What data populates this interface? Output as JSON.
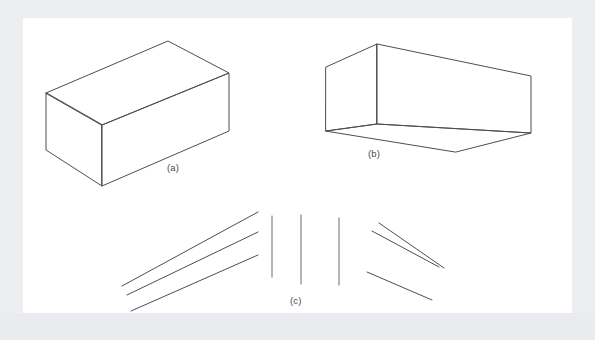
{
  "figure": {
    "background_color": "#eceef0",
    "plate_color": "#ffffff",
    "stroke_color": "#4d4d55",
    "label_color": "#4a4a4f",
    "panels": [
      {
        "id": "a",
        "label": "(a)",
        "description": "Wireframe rectangular block seen from above, left-facing",
        "label_x": 167,
        "label_y": 162
      },
      {
        "id": "b",
        "label": "(b)",
        "description": "Wireframe rectangular block seen from below, right-facing",
        "label_x": 368,
        "label_y": 148
      },
      {
        "id": "c",
        "label": "(c)",
        "description": "Three groups of line segments: diverging, parallel vertical, converging",
        "label_x": 290,
        "label_y": 295
      }
    ],
    "footer_text": "",
    "shapes": {
      "box_a": {
        "type": "polyline-set",
        "stroke": "#4d4d55",
        "stroke_width": 1,
        "vertices": {
          "top_apex": [
            168,
            41
          ],
          "top_left": [
            46,
            93
          ],
          "top_front": [
            102,
            125
          ],
          "top_right": [
            229,
            73
          ],
          "bottom_right": [
            229,
            131
          ],
          "bottom_front": [
            102,
            186
          ],
          "bottom_left": [
            46,
            150
          ]
        },
        "edges": [
          [
            "top_left",
            "top_apex"
          ],
          [
            "top_apex",
            "top_right"
          ],
          [
            "top_right",
            "top_front"
          ],
          [
            "top_front",
            "top_left"
          ],
          [
            "top_left",
            "bottom_left"
          ],
          [
            "bottom_left",
            "bottom_front"
          ],
          [
            "top_front",
            "bottom_front"
          ],
          [
            "bottom_front",
            "bottom_right"
          ],
          [
            "top_right",
            "bottom_right"
          ]
        ]
      },
      "box_b": {
        "type": "polyline-set",
        "stroke": "#4d4d55",
        "stroke_width": 1,
        "vertices": {
          "top_apex": [
            377,
            44
          ],
          "top_left": [
            326,
            67
          ],
          "top_right": [
            531,
            76
          ],
          "mid_front": [
            377,
            124
          ],
          "bottom_left": [
            326,
            131
          ],
          "bottom_right": [
            531,
            133
          ],
          "bottom_front": [
            456,
            152
          ]
        },
        "edges": [
          [
            "top_left",
            "top_apex"
          ],
          [
            "top_apex",
            "top_right"
          ],
          [
            "top_apex",
            "mid_front"
          ],
          [
            "top_left",
            "bottom_left"
          ],
          [
            "top_right",
            "bottom_right"
          ],
          [
            "bottom_left",
            "mid_front"
          ],
          [
            "mid_front",
            "bottom_right"
          ],
          [
            "bottom_left",
            "bottom_front"
          ],
          [
            "bottom_front",
            "bottom_right"
          ]
        ]
      },
      "lines_c_left_diverging": {
        "type": "segments",
        "stroke": "#4d4d55",
        "stroke_width": 1,
        "count": 3,
        "segments": [
          [
            122,
            286,
            258,
            212
          ],
          [
            127,
            295,
            258,
            232
          ],
          [
            131,
            311,
            258,
            255
          ]
        ]
      },
      "lines_c_middle_vertical": {
        "type": "segments",
        "stroke": "#4d4d55",
        "stroke_width": 1,
        "count": 3,
        "segments": [
          [
            272,
            216,
            272,
            277
          ],
          [
            301,
            215,
            301,
            284
          ],
          [
            339,
            218,
            339,
            285
          ]
        ]
      },
      "lines_c_right_converging": {
        "type": "segments",
        "stroke": "#4d4d55",
        "stroke_width": 1,
        "count": 3,
        "segments": [
          [
            379,
            223,
            444,
            268
          ],
          [
            372,
            231,
            439,
            267
          ],
          [
            367,
            272,
            432,
            300
          ]
        ]
      }
    }
  }
}
